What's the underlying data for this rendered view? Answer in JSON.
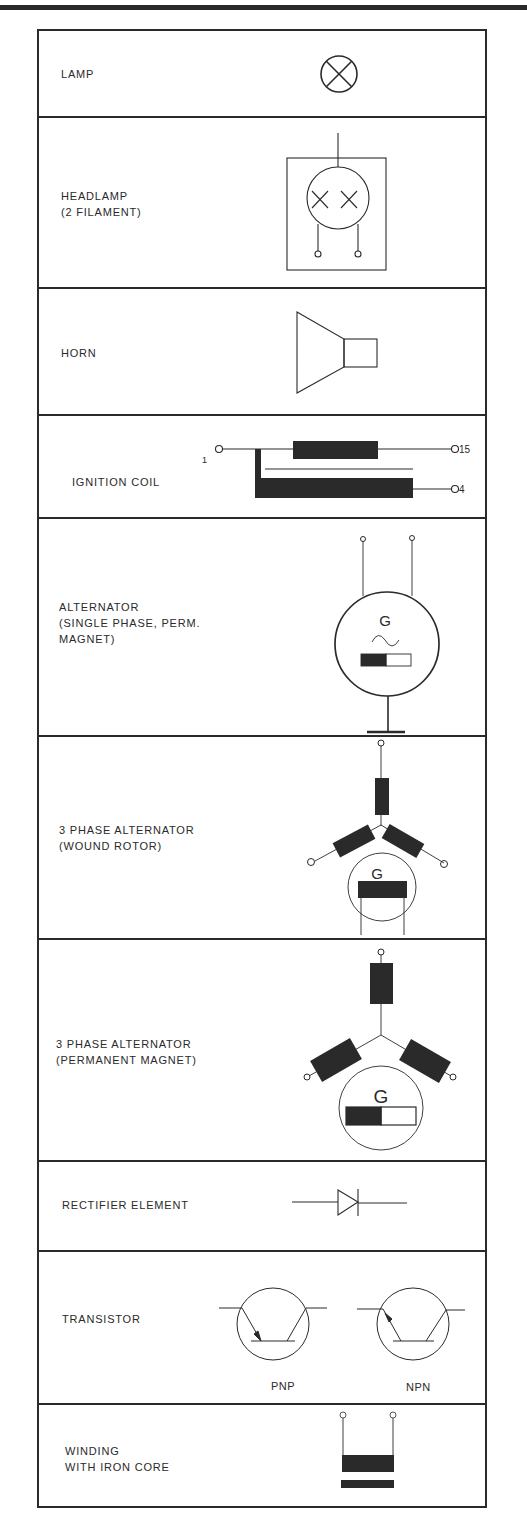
{
  "rows": [
    {
      "label": "LAMP",
      "symbol": "lamp-icon"
    },
    {
      "label": "HEADLAMP\n(2 FILAMENT)",
      "symbol": "headlamp-icon"
    },
    {
      "label": "HORN",
      "symbol": "horn-icon"
    },
    {
      "label": "IGNITION COIL",
      "symbol": "ignition-coil-icon",
      "terminals": [
        "1",
        "15",
        "4"
      ]
    },
    {
      "label": "ALTERNATOR\n(SINGLE PHASE, PERM.\nMAGNET)",
      "symbol": "alternator-icon",
      "glyph": "G"
    },
    {
      "label": "3 PHASE ALTERNATOR\n(WOUND ROTOR)",
      "symbol": "three-phase-wound-rotor-icon",
      "glyph": "G"
    },
    {
      "label": "3 PHASE ALTERNATOR\n(PERMANENT MAGNET)",
      "symbol": "three-phase-pm-icon",
      "glyph": "G"
    },
    {
      "label": "RECTIFIER ELEMENT",
      "symbol": "diode-icon"
    },
    {
      "label": "TRANSISTOR",
      "symbol": "transistor-icon",
      "variants": [
        "PNP",
        "NPN"
      ]
    },
    {
      "label": "WINDING\nWITH IRON CORE",
      "symbol": "winding-iron-core-icon"
    }
  ],
  "colors": {
    "ink": "#2a2a2a",
    "paper": "#ffffff"
  }
}
